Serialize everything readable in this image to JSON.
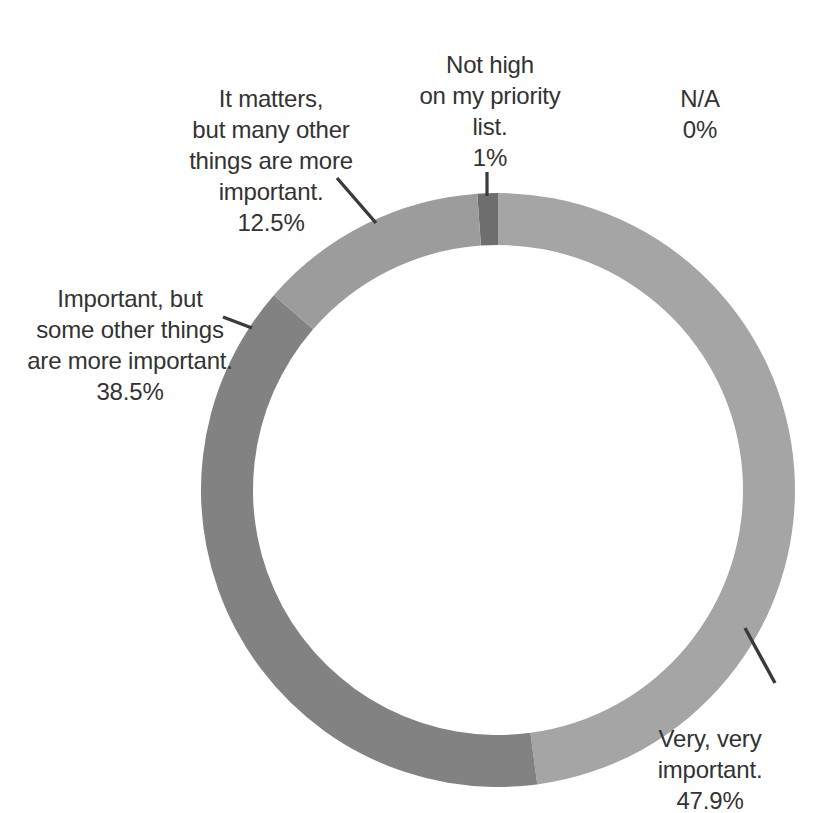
{
  "chart_data": {
    "type": "pie",
    "variant": "donut",
    "title": "",
    "subtitle": "",
    "xlabel": "",
    "ylabel": "",
    "grid": false,
    "legend_position": "none",
    "labels_outside": true,
    "center": {
      "x": 498,
      "y": 490
    },
    "outer_radius": 297,
    "inner_radius": 245,
    "start_angle_deg": -4,
    "categories": [
      "Not high on my priority list.",
      "Very, very important.",
      "Important, but some other things are more important.",
      "It matters, but many other things are more important.",
      "N/A"
    ],
    "values": [
      1,
      47.9,
      38.5,
      12.5,
      0
    ],
    "value_labels": [
      "1%",
      "47.9%",
      "38.5%",
      "12.5%",
      "0%"
    ],
    "colors": [
      "#6e6e6e",
      "#a5a5a5",
      "#828282",
      "#9c9c9c",
      "#cccccc"
    ],
    "slices": [
      {
        "name": "Not high on my priority list.",
        "value": 1,
        "value_label": "1%",
        "color": "#6e6e6e",
        "start_deg": -4.0,
        "end_deg": 0.0
      },
      {
        "name": "Very, very important.",
        "value": 47.9,
        "value_label": "47.9%",
        "color": "#a5a5a5",
        "start_deg": 0.0,
        "end_deg": 172.4
      },
      {
        "name": "Important, but some other things are more important.",
        "value": 38.5,
        "value_label": "38.5%",
        "color": "#828282",
        "start_deg": 172.4,
        "end_deg": 311.0
      },
      {
        "name": "It matters, but many other things are more important.",
        "value": 12.5,
        "value_label": "12.5%",
        "color": "#9c9c9c",
        "start_deg": 311.0,
        "end_deg": 356.0
      },
      {
        "name": "N/A",
        "value": 0,
        "value_label": "0%",
        "color": "#cccccc",
        "start_deg": 356.0,
        "end_deg": 356.0
      }
    ]
  },
  "labels": {
    "not_high": {
      "text": "Not high\non my priority\nlist.",
      "percent": "1%"
    },
    "it_matters": {
      "text": "It matters,\nbut many other\nthings are more\nimportant.",
      "percent": "12.5%"
    },
    "na": {
      "text": "N/A",
      "percent": "0%"
    },
    "important_some": {
      "text": "Important, but\nsome other things\nare more important.",
      "percent": "38.5%"
    },
    "very_very": {
      "text": "Very, very\nimportant.",
      "percent": "47.9%"
    }
  },
  "style": {
    "background": "#ffffff",
    "text_color": "#333333",
    "leader_color": "#3a3a3a"
  }
}
